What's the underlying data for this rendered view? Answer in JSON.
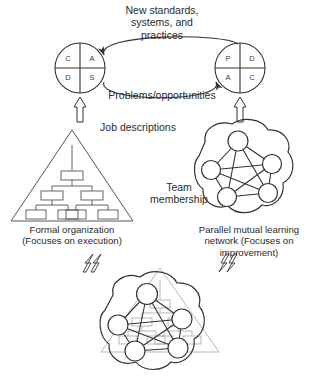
{
  "figure": {
    "type": "organizational-diagram",
    "title_top": "New standards,\nsystems, and\npractices",
    "labels": {
      "new_standards": "New standards, systems, and practices",
      "new_standards_l1": "New standards,",
      "new_standards_l2": "systems, and",
      "new_standards_l3": "practices",
      "problems": "Problems/opportunities",
      "job_descriptions": "Job descriptions",
      "team_membership_l1": "Team",
      "team_membership_l2": "membership",
      "formal_l1": "Formal organization",
      "formal_l2": "(Focuses on execution)",
      "parallel_l1": "Parallel mutual learning",
      "parallel_l2": "network (Focuses on",
      "parallel_l3": "improvement)",
      "bottom_caption": ""
    },
    "left_circle": {
      "name": "CADS cycle",
      "quadrants": [
        {
          "pos": "top-left",
          "letter": "C"
        },
        {
          "pos": "top-right",
          "letter": "A"
        },
        {
          "pos": "bottom-left",
          "letter": "D"
        },
        {
          "pos": "bottom-right",
          "letter": "S"
        }
      ]
    },
    "right_circle": {
      "name": "PDCA cycle",
      "quadrants": [
        {
          "pos": "top-left",
          "letter": "P"
        },
        {
          "pos": "top-right",
          "letter": "D"
        },
        {
          "pos": "bottom-left",
          "letter": "A"
        },
        {
          "pos": "bottom-right",
          "letter": "C"
        }
      ]
    },
    "flows": [
      {
        "from": "right_circle",
        "to": "left_circle",
        "label": "New standards, systems, and practices"
      },
      {
        "from": "left_circle",
        "to": "right_circle",
        "label": "Problems/opportunities"
      },
      {
        "from": "formal_organization",
        "to": "left_circle",
        "label": "Job descriptions",
        "style": "block-arrow-up"
      },
      {
        "from": "learning_network",
        "to": "right_circle",
        "label": "Team membership",
        "style": "block-arrow-up"
      },
      {
        "from": "overlay",
        "to": "formal_organization",
        "style": "block-arrow-up-left"
      },
      {
        "from": "overlay",
        "to": "learning_network",
        "style": "block-arrow-up-right"
      }
    ],
    "network": {
      "node_count": 5,
      "fully_connected": true
    },
    "colors": {
      "stroke": "#333333",
      "text": "#2b2b2b",
      "faint": "#a8a8a8",
      "background": "#ffffff"
    }
  }
}
